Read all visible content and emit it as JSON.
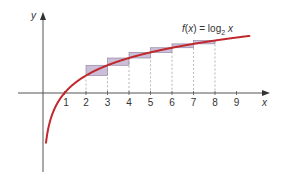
{
  "chart_data": {
    "type": "line",
    "title": "",
    "function_label": {
      "prefix": "f(",
      "var": "x",
      "mid": ") = log",
      "sub": "2",
      "suffix": " x"
    },
    "xlabel": "x",
    "ylabel": "y",
    "x_ticks": [
      "1",
      "2",
      "3",
      "4",
      "5",
      "6",
      "7",
      "8",
      "9"
    ],
    "xlim": [
      -0.9,
      10.5
    ],
    "ylim": [
      -4.8,
      4.6
    ],
    "grid": false,
    "legend": "none",
    "series": [
      {
        "name": "f(x) = log2 x",
        "color": "#c0282d",
        "x": [
          0.15,
          0.25,
          0.5,
          1,
          2,
          3,
          4,
          5,
          6,
          7,
          8,
          9,
          9.6
        ],
        "y": [
          -2.74,
          -2.0,
          -1.0,
          0,
          1,
          1.585,
          2,
          2.322,
          2.585,
          2.807,
          3,
          3.17,
          3.263
        ]
      }
    ],
    "shaded_rectangles": {
      "color": "#b9a9c9",
      "border": "#8a7a9c",
      "intervals": [
        {
          "x0": 2,
          "x1": 3,
          "y_low": 1.0,
          "y_high": 1.585
        },
        {
          "x0": 3,
          "x1": 4,
          "y_low": 1.585,
          "y_high": 2.0
        },
        {
          "x0": 4,
          "x1": 5,
          "y_low": 2.0,
          "y_high": 2.322
        },
        {
          "x0": 5,
          "x1": 6,
          "y_low": 2.322,
          "y_high": 2.585
        },
        {
          "x0": 6,
          "x1": 7,
          "y_low": 2.585,
          "y_high": 2.807
        },
        {
          "x0": 7,
          "x1": 8,
          "y_low": 2.807,
          "y_high": 3.0
        }
      ]
    },
    "dashed_verticals_at": [
      2,
      3,
      4,
      5,
      6,
      7,
      8
    ]
  }
}
